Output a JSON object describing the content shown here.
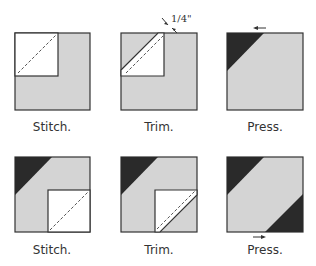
{
  "diagram": {
    "rows": [
      {
        "steps": [
          {
            "label": "Stitch."
          },
          {
            "label": "Trim."
          },
          {
            "label": "Press."
          }
        ]
      },
      {
        "steps": [
          {
            "label": "Stitch."
          },
          {
            "label": "Trim."
          },
          {
            "label": "Press."
          }
        ]
      }
    ],
    "annotation": "1/4\"",
    "colors": {
      "fabric_light": "#d4d4d4",
      "fabric_dark": "#2a2a2a",
      "outline": "#333333"
    }
  }
}
